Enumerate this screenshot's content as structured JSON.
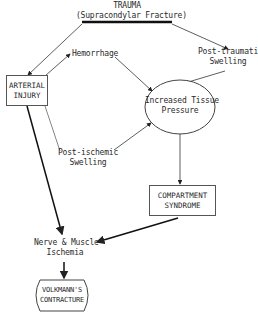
{
  "diagram": {
    "title": "TRAUMA",
    "subtitle": "(Supracondylar Fracture)",
    "nodes": {
      "arterial_injury": {
        "line1": "ARTERIAL",
        "line2": "INJURY"
      },
      "hemorrhage": {
        "label": "Hemorrhage"
      },
      "post_traumatic_swelling": {
        "line1": "Post-traumatic",
        "line2": "Swelling"
      },
      "increased_tissue_pressure": {
        "line1": "Increased Tissue",
        "line2": "Pressure"
      },
      "post_ischemic_swelling": {
        "line1": "Post-ischemic",
        "line2": "Swelling"
      },
      "compartment_syndrome": {
        "line1": "COMPARTMENT",
        "line2": "SYNDROME"
      },
      "nerve_muscle_ischemia": {
        "line1": "Nerve & Muscle",
        "line2": "Ischemia"
      },
      "volkmanns_contracture": {
        "line1": "VOLKMANN'S",
        "line2": "CONTRACTURE"
      }
    },
    "edges": [
      {
        "from": "trauma",
        "to": "arterial_injury"
      },
      {
        "from": "trauma",
        "to": "post_traumatic_swelling"
      },
      {
        "from": "arterial_injury",
        "to": "hemorrhage"
      },
      {
        "from": "hemorrhage",
        "to": "increased_tissue_pressure"
      },
      {
        "from": "post_traumatic_swelling",
        "to": "increased_tissue_pressure"
      },
      {
        "from": "arterial_injury",
        "to": "post_ischemic_swelling"
      },
      {
        "from": "post_ischemic_swelling",
        "to": "increased_tissue_pressure"
      },
      {
        "from": "increased_tissue_pressure",
        "to": "compartment_syndrome"
      },
      {
        "from": "compartment_syndrome",
        "to": "nerve_muscle_ischemia"
      },
      {
        "from": "arterial_injury",
        "to": "nerve_muscle_ischemia"
      },
      {
        "from": "nerve_muscle_ischemia",
        "to": "volkmanns_contracture"
      }
    ]
  }
}
